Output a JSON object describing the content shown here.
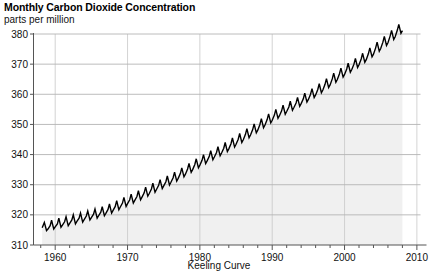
{
  "chart_data": {
    "type": "line",
    "title": "Monthly Carbon Dioxide Concentration",
    "subtitle": "parts per million",
    "caption": "Keeling Curve",
    "xlabel": "",
    "ylabel": "parts per million",
    "grid": true,
    "legend": "none",
    "xlim": [
      1957,
      2010.5
    ],
    "ylim": [
      310,
      385
    ],
    "yticks": [
      310,
      320,
      330,
      340,
      350,
      360,
      370,
      380
    ],
    "ytick_labels": [
      "310",
      "320",
      "330",
      "340",
      "350",
      "360",
      "370",
      "380"
    ],
    "xticks": [
      1960,
      1970,
      1980,
      1990,
      2000,
      2010
    ],
    "xtick_labels": [
      "1960",
      "1970",
      "1980",
      "1990",
      "2000",
      "2010"
    ],
    "xminor_step": 2,
    "line_color": "#000000",
    "fill_color": "#f0f0f0",
    "grid_color": "#b4b4b4",
    "axis_color": "#555555",
    "series": [
      {
        "name": "Monthly mean CO2 (Mauna Loa)",
        "x": [
          1958.2,
          1958.5,
          1958.8,
          1959.0,
          1959.3,
          1959.5,
          1959.8,
          1960.0,
          1960.3,
          1960.5,
          1960.8,
          1961.0,
          1961.3,
          1961.5,
          1961.8,
          1962.0,
          1962.3,
          1962.5,
          1962.8,
          1963.0,
          1963.3,
          1963.5,
          1963.8,
          1964.0,
          1964.3,
          1964.5,
          1964.8,
          1965.0,
          1965.3,
          1965.5,
          1965.8,
          1966.0,
          1966.3,
          1966.5,
          1966.8,
          1967.0,
          1967.3,
          1967.5,
          1967.8,
          1968.0,
          1968.3,
          1968.5,
          1968.8,
          1969.0,
          1969.3,
          1969.5,
          1969.8,
          1970.0,
          1970.3,
          1970.5,
          1970.8,
          1971.0,
          1971.3,
          1971.5,
          1971.8,
          1972.0,
          1972.3,
          1972.5,
          1972.8,
          1973.0,
          1973.3,
          1973.5,
          1973.8,
          1974.0,
          1974.3,
          1974.5,
          1974.8,
          1975.0,
          1975.3,
          1975.5,
          1975.8,
          1976.0,
          1976.3,
          1976.5,
          1976.8,
          1977.0,
          1977.3,
          1977.5,
          1977.8,
          1978.0,
          1978.3,
          1978.5,
          1978.8,
          1979.0,
          1979.3,
          1979.5,
          1979.8,
          1980.0,
          1980.3,
          1980.5,
          1980.8,
          1981.0,
          1981.3,
          1981.5,
          1981.8,
          1982.0,
          1982.3,
          1982.5,
          1982.8,
          1983.0,
          1983.3,
          1983.5,
          1983.8,
          1984.0,
          1984.3,
          1984.5,
          1984.8,
          1985.0,
          1985.3,
          1985.5,
          1985.8,
          1986.0,
          1986.3,
          1986.5,
          1986.8,
          1987.0,
          1987.3,
          1987.5,
          1987.8,
          1988.0,
          1988.3,
          1988.5,
          1988.8,
          1989.0,
          1989.3,
          1989.5,
          1989.8,
          1990.0,
          1990.3,
          1990.5,
          1990.8,
          1991.0,
          1991.3,
          1991.5,
          1991.8,
          1992.0,
          1992.3,
          1992.5,
          1992.8,
          1993.0,
          1993.3,
          1993.5,
          1993.8,
          1994.0,
          1994.3,
          1994.5,
          1994.8,
          1995.0,
          1995.3,
          1995.5,
          1995.8,
          1996.0,
          1996.3,
          1996.5,
          1996.8,
          1997.0,
          1997.3,
          1997.5,
          1997.8,
          1998.0,
          1998.3,
          1998.5,
          1998.8,
          1999.0,
          1999.3,
          1999.5,
          1999.8,
          2000.0,
          2000.3,
          2000.5,
          2000.8,
          2001.0,
          2001.3,
          2001.5,
          2001.8,
          2002.0,
          2002.3,
          2002.5,
          2002.8,
          2003.0,
          2003.3,
          2003.5,
          2003.8,
          2004.0,
          2004.3,
          2004.5,
          2004.8,
          2005.0,
          2005.3,
          2005.5,
          2005.8,
          2006.0,
          2006.3,
          2006.5,
          2006.8,
          2007.0,
          2007.3,
          2007.5,
          2007.8,
          2008.0
        ],
        "y": [
          315.7,
          317.5,
          314.8,
          315.3,
          316.4,
          318.2,
          315.3,
          316.0,
          317.0,
          318.9,
          315.9,
          316.6,
          317.7,
          319.4,
          316.4,
          317.2,
          318.3,
          320.0,
          317.0,
          317.8,
          318.9,
          320.6,
          317.6,
          318.4,
          319.6,
          321.3,
          318.3,
          319.1,
          320.2,
          321.9,
          318.9,
          319.7,
          320.9,
          322.7,
          319.7,
          320.5,
          321.8,
          323.6,
          320.6,
          321.5,
          322.8,
          324.7,
          321.7,
          322.6,
          323.9,
          325.8,
          322.8,
          323.7,
          325.0,
          326.9,
          323.9,
          324.8,
          326.1,
          328.0,
          325.0,
          325.9,
          327.3,
          329.2,
          326.2,
          327.1,
          328.6,
          330.5,
          327.5,
          328.4,
          329.8,
          331.7,
          328.7,
          329.6,
          331.0,
          332.9,
          329.9,
          330.8,
          332.3,
          334.2,
          331.2,
          332.1,
          333.7,
          335.6,
          332.6,
          333.5,
          335.2,
          337.1,
          334.1,
          335.0,
          336.7,
          338.6,
          335.6,
          336.5,
          338.1,
          340.0,
          337.0,
          337.9,
          339.4,
          341.3,
          338.3,
          339.2,
          340.7,
          342.6,
          339.6,
          340.5,
          342.1,
          344.0,
          341.0,
          341.9,
          343.6,
          345.5,
          342.5,
          343.4,
          345.1,
          347.0,
          344.0,
          344.9,
          346.7,
          348.6,
          345.6,
          346.5,
          348.3,
          350.2,
          347.2,
          348.1,
          350.0,
          351.9,
          348.9,
          349.8,
          351.6,
          353.5,
          350.5,
          351.4,
          353.1,
          355.0,
          352.0,
          352.9,
          354.5,
          356.4,
          353.4,
          354.3,
          355.8,
          357.7,
          354.7,
          355.6,
          357.1,
          359.0,
          356.0,
          356.9,
          358.5,
          360.4,
          357.4,
          358.3,
          360.0,
          361.9,
          358.9,
          359.8,
          361.6,
          363.5,
          360.5,
          361.4,
          363.3,
          365.2,
          362.2,
          363.1,
          365.1,
          367.0,
          364.0,
          364.9,
          366.8,
          368.7,
          365.7,
          366.6,
          368.4,
          370.3,
          367.3,
          368.2,
          370.0,
          371.9,
          368.9,
          369.8,
          371.7,
          373.6,
          370.6,
          371.5,
          373.5,
          375.4,
          372.4,
          373.3,
          375.4,
          377.3,
          374.3,
          375.2,
          377.3,
          379.2,
          376.2,
          377.1,
          379.3,
          381.2,
          378.2,
          379.1,
          381.3,
          383.2,
          380.2,
          381.1
        ]
      }
    ]
  }
}
